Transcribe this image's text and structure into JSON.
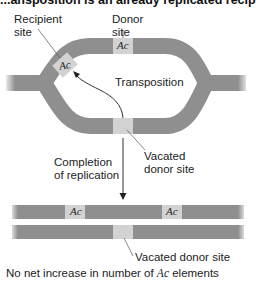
{
  "title_fragment": "...ansposition is an already replicated recipient s...",
  "labels": {
    "recipient_site": [
      "Recipient",
      "site"
    ],
    "donor_site": [
      "Donor",
      "site"
    ],
    "transposition": "Transposition",
    "vacated_donor_site_top": [
      "Vacated",
      "donor site"
    ],
    "completion": [
      "Completion",
      "of replication"
    ],
    "vacated_donor_site_bottom": "Vacated donor site",
    "caption_prefix": "No net increase in number of ",
    "caption_element": "Ac",
    "caption_suffix": " elements"
  },
  "elements": {
    "recipient_ac": "Ac",
    "donor_ac": "Ac",
    "product_ac_1": "Ac",
    "product_ac_2": "Ac"
  },
  "colors": {
    "dna_strand": "#8f8f8f",
    "element_box": "#d2d2d2",
    "line": "#333333"
  }
}
